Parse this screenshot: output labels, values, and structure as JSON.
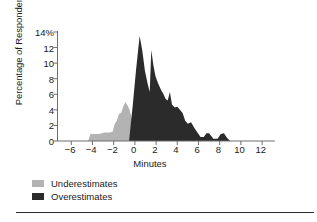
{
  "chart_data": {
    "type": "area",
    "title": "",
    "xlabel": "Minutes",
    "ylabel": "Percentage of Respondents",
    "xlim": [
      -7.3,
      13.2
    ],
    "ylim": [
      0,
      14
    ],
    "grid": false,
    "legend_position": "below-left",
    "xticks": [
      -6,
      -4,
      -2,
      0,
      2,
      4,
      6,
      8,
      10,
      12
    ],
    "xtick_labels": [
      "−6",
      "−4",
      "−2",
      "0",
      "2",
      "4",
      "6",
      "8",
      "10",
      "12"
    ],
    "yticks": [
      0,
      2,
      4,
      6,
      8,
      10,
      12,
      14
    ],
    "ytick_labels": [
      "0",
      "2",
      "4",
      "6",
      "8",
      "10",
      "12",
      "14%"
    ],
    "colors": {
      "underestimates": "#b3b3b3",
      "overestimates": "#2b2b2b",
      "axis": "#6e6e6e",
      "text": "#1a1a1a"
    },
    "series": [
      {
        "name": "Underestimates",
        "color": "#b3b3b3",
        "x": [
          -4.4,
          -4.2,
          -3.9,
          -3.6,
          -3.4,
          -3.1,
          -2.9,
          -2.6,
          -2.4,
          -2.1,
          -1.9,
          -1.7,
          -1.5,
          -1.3,
          -1.1,
          -0.9,
          -0.7,
          -0.5,
          -0.3,
          -0.15,
          0
        ],
        "values": [
          0,
          0.9,
          0.9,
          0.9,
          0.9,
          1.0,
          1.1,
          1.1,
          1.1,
          1.2,
          2.2,
          2.6,
          3.5,
          3.6,
          4.4,
          5.0,
          4.6,
          4.0,
          3.0,
          1.6,
          0
        ]
      },
      {
        "name": "Overestimates",
        "color": "#2b2b2b",
        "x": [
          -0.55,
          -0.2,
          0.1,
          0.3,
          0.45,
          0.7,
          0.95,
          1.2,
          1.4,
          1.55,
          1.75,
          1.95,
          2.2,
          2.45,
          2.7,
          2.9,
          3.1,
          3.3,
          3.5,
          3.75,
          4.0,
          4.25,
          4.5,
          4.75,
          5.0,
          5.3,
          5.6,
          5.9,
          6.2,
          6.5,
          6.75,
          7.0,
          7.4,
          7.8,
          8.1,
          8.4,
          8.7,
          9.0
        ],
        "values": [
          0,
          4.6,
          9.0,
          11.6,
          13.5,
          11.6,
          9.0,
          7.4,
          6.3,
          11.7,
          9.7,
          8.3,
          7.4,
          6.6,
          6.0,
          5.4,
          5.2,
          6.3,
          4.7,
          4.3,
          4.4,
          4.0,
          3.6,
          2.6,
          2.2,
          2.4,
          1.7,
          1.1,
          0.5,
          0.5,
          1.0,
          1.0,
          0.3,
          0.3,
          0.9,
          1.0,
          0.4,
          0
        ]
      }
    ]
  },
  "legend": {
    "items": [
      {
        "label": "Underestimates",
        "color": "#b3b3b3"
      },
      {
        "label": "Overestimates",
        "color": "#2b2b2b"
      }
    ]
  }
}
